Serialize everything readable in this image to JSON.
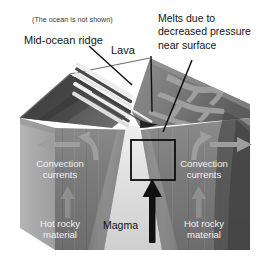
{
  "figure": {
    "kind": "geology-block-diagram",
    "background_color": "#ffffff"
  },
  "labels": {
    "ocean_note": "(The ocean is not shown)",
    "mid_ocean_ridge": "Mid-ocean ridge",
    "lava": "Lava",
    "melts_line1": "Melts due to",
    "melts_line2": "decreased pressure",
    "melts_line3": "near surface",
    "convection_left_line1": "Convection",
    "convection_left_line2": "currents",
    "convection_right_line1": "Convection",
    "convection_right_line2": "currents",
    "hot_left_line1": "Hot rocky",
    "hot_left_line2": "material",
    "hot_right_line1": "Hot rocky",
    "hot_right_line2": "material",
    "magma": "Magma"
  },
  "colors": {
    "background": "#ffffff",
    "crust_top_dark": "#4a4a4a",
    "crust_top_mid": "#6e6e6e",
    "crust_top_light": "#9a9a9a",
    "mantle_body": "#7c7c7c",
    "mantle_side": "#a8a8a8",
    "magma_plume": "#d8d8d8",
    "ridge_stripe_light": "#e8e8e8",
    "ridge_stripe_dark": "#3c3c3c",
    "arrow_gray": "#9b9b9b",
    "arrow_black": "#111111",
    "leader_line": "#111111",
    "label_light": "#f2f2f2",
    "label_dark": "#141414"
  },
  "annotations": {
    "box_outline": "magma-focus-box",
    "arrows": {
      "left_horizontal": "left-spreading-arrow",
      "left_curved": "left-convection-curve",
      "left_up": "left-upwelling-arrow",
      "right_horizontal": "right-spreading-arrow",
      "right_curved": "right-convection-curve",
      "right_up": "right-upwelling-arrow",
      "magma_up": "magma-rising-arrow"
    },
    "leaders": {
      "ridge": "mid-ocean-ridge-leader",
      "lava": "lava-leader",
      "melts": "melts-leader"
    }
  }
}
